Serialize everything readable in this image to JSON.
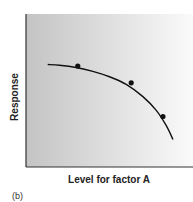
{
  "chart_data": {
    "type": "line",
    "title": "",
    "xlabel": "Level for factor A",
    "ylabel": "Response",
    "panel_label": "(b)",
    "grid": false,
    "ticks": false,
    "legend": null,
    "curve": {
      "x": [
        0.13,
        0.2,
        0.3,
        0.4,
        0.5,
        0.6,
        0.7,
        0.78,
        0.84,
        0.88
      ],
      "y": [
        0.67,
        0.665,
        0.65,
        0.625,
        0.59,
        0.54,
        0.46,
        0.37,
        0.27,
        0.18
      ]
    },
    "points": {
      "x": [
        0.31,
        0.63,
        0.82
      ],
      "y": [
        0.66,
        0.55,
        0.33
      ]
    },
    "xlim": [
      0,
      1
    ],
    "ylim": [
      0,
      1
    ],
    "colors": {
      "line": "#111111",
      "points": "#111111",
      "background_left": "#c4c4c4",
      "background_right": "#fafafa",
      "axis": "#333333"
    }
  }
}
